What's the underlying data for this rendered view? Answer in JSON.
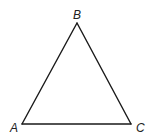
{
  "diagram": {
    "type": "triangle",
    "vertices": [
      {
        "id": "A",
        "label": "A"
      },
      {
        "id": "B",
        "label": "B"
      },
      {
        "id": "C",
        "label": "C"
      }
    ],
    "edges": [
      {
        "from": "A",
        "to": "B"
      },
      {
        "from": "B",
        "to": "C"
      },
      {
        "from": "C",
        "to": "A"
      }
    ],
    "stroke_color": "#1a1a1a",
    "label_color": "#222222"
  }
}
